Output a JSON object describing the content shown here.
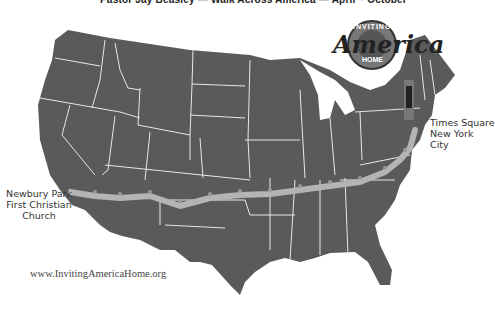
{
  "header": {
    "caption": "Pastor Jay Beasley — Walk Across America — April – October"
  },
  "logo": {
    "top_text": "INVITING",
    "script_text": "America",
    "bottom_text": "HOME"
  },
  "labels": {
    "end": {
      "line1": "Times Square",
      "line2": "New York City"
    },
    "start": {
      "line1": "Newbury Park",
      "line2": "First Christian",
      "line3": "Church"
    }
  },
  "footer": {
    "url": "www.InvitingAmericaHome.org"
  },
  "colors": {
    "land": "#5a5a5a",
    "borders": "#e8e8e8",
    "route": "#b4b4b4",
    "background": "#ffffff"
  }
}
